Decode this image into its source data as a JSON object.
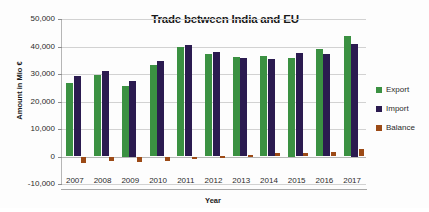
{
  "chart_data": {
    "type": "bar",
    "title": "Trade between India and EU",
    "xlabel": "Year",
    "ylabel": "Amount in Mio €",
    "categories": [
      "2007",
      "2008",
      "2009",
      "2010",
      "2011",
      "2012",
      "2013",
      "2014",
      "2015",
      "2016",
      "2017"
    ],
    "series": [
      {
        "name": "Export",
        "color": "#3b9142",
        "values": [
          26800,
          29700,
          25500,
          33200,
          39700,
          37400,
          36300,
          36700,
          36000,
          39100,
          43700
        ]
      },
      {
        "name": "Import",
        "color": "#2b1b50",
        "values": [
          29200,
          31200,
          27500,
          34800,
          40400,
          38100,
          35900,
          35400,
          37600,
          37400,
          41000
        ]
      },
      {
        "name": "Balance",
        "color": "#9c4a16",
        "values": [
          -2400,
          -1500,
          -2000,
          -1600,
          -700,
          300,
          700,
          1300,
          1200,
          1700,
          2700
        ]
      }
    ],
    "ylim": [
      -10000,
      50000
    ],
    "ytick_labels": [
      "50,000",
      "40,000",
      "30,000",
      "20,000",
      "10,000",
      "0",
      "-10,000"
    ],
    "ytick_values": [
      50000,
      40000,
      30000,
      20000,
      10000,
      0,
      -10000
    ],
    "grid": true,
    "legend_position": "right"
  },
  "legend": {
    "items": [
      {
        "label": "Export"
      },
      {
        "label": "Import"
      },
      {
        "label": "Balance"
      }
    ]
  }
}
